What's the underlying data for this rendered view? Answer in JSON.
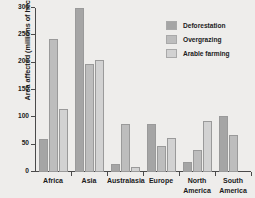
{
  "chart_data": {
    "type": "bar",
    "title": "",
    "xlabel": "",
    "ylabel": "Area affected (millions of hectares)",
    "categories": [
      "Africa",
      "Asia",
      "Australasia",
      "Europe",
      "North\nAmerica",
      "South\nAmerica"
    ],
    "series": [
      {
        "name": "Deforestation",
        "values": [
          60,
          300,
          15,
          88,
          18,
          103
        ]
      },
      {
        "name": "Overgrazing",
        "values": [
          243,
          198,
          87,
          48,
          40,
          67
        ]
      },
      {
        "name": "Arable farming",
        "values": [
          115,
          204,
          10,
          62,
          93,
          null
        ]
      }
    ],
    "ylim": [
      0,
      300
    ],
    "yticks": [
      0,
      50,
      100,
      150,
      200,
      250,
      300
    ],
    "ytick_labels": [
      "0",
      "50",
      "100",
      "150",
      "200",
      "250",
      "300"
    ],
    "grid": false,
    "legend_position": "top-right",
    "colors": {
      "background": "#eeedeb",
      "axis": "#4a4a4a",
      "text": "#1b1b1b",
      "deforestation": "#a5a5a5",
      "overgrazing": "#bdbdbd",
      "arable_farming": "#d2d2d2"
    }
  }
}
